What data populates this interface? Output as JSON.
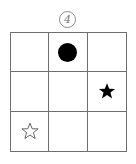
{
  "figure": {
    "label": "4",
    "grid": {
      "rows": 3,
      "cols": 3
    },
    "line_color": "#6e6e6e",
    "cells": [
      {
        "row": 0,
        "col": 0,
        "symbol": ""
      },
      {
        "row": 0,
        "col": 1,
        "symbol": "filled-circle",
        "color": "#000000"
      },
      {
        "row": 0,
        "col": 2,
        "symbol": ""
      },
      {
        "row": 1,
        "col": 0,
        "symbol": ""
      },
      {
        "row": 1,
        "col": 1,
        "symbol": ""
      },
      {
        "row": 1,
        "col": 2,
        "symbol": "filled-star",
        "color": "#000000"
      },
      {
        "row": 2,
        "col": 0,
        "symbol": "outline-star",
        "color": "#555555"
      },
      {
        "row": 2,
        "col": 1,
        "symbol": ""
      },
      {
        "row": 2,
        "col": 2,
        "symbol": ""
      }
    ]
  }
}
